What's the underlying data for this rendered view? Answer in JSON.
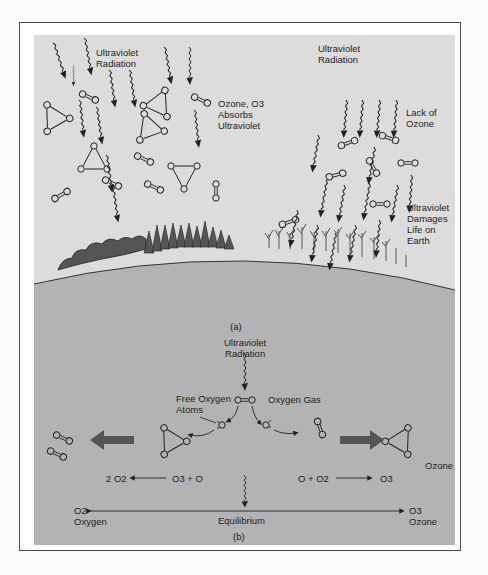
{
  "colors": {
    "page_bg": "#fbfbfb",
    "sky": "#dcdcdc",
    "ground": "#b3b3b3",
    "line": "#222222",
    "big_arrow": "#555555"
  },
  "panel_a": {
    "caption": "(a)",
    "left_side": {
      "uv_label": "Ultraviolet\nRadiation",
      "ozone_label": "Ozone, O3\nAbsorbs\nUltraviolet"
    },
    "right_side": {
      "uv_label": "Ultraviolet\nRadiation",
      "lack_label": "Lack of\nOzone",
      "damage_label": "Ultraviolet\nDamages\nLife on\nEarth"
    }
  },
  "panel_b": {
    "caption": "(b)",
    "uv_label": "Ultraviolet\nRadiation",
    "oxygen_gas_label": "Oxygen Gas",
    "free_oxygen_label": "Free Oxygen\nAtoms",
    "ozone_label": "Ozone",
    "o2_molecule": "O=O",
    "reaction_left": {
      "reactants": "O3 + O",
      "products": "2 O2"
    },
    "reaction_right": {
      "reactants": "O + O2",
      "products": "O3"
    },
    "equilibrium": {
      "label": "Equilibrium",
      "left_formula": "O2",
      "left_name": "Oxygen",
      "right_formula": "O3",
      "right_name": "Ozone"
    }
  }
}
